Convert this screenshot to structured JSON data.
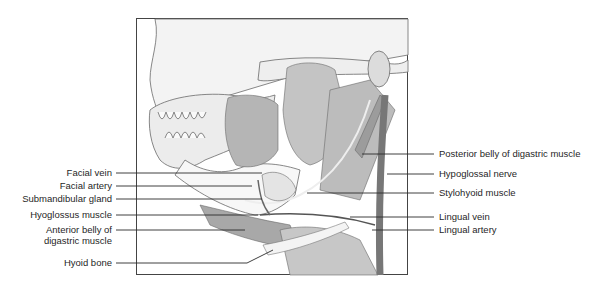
{
  "figure": {
    "frame": {
      "x": 136,
      "y": 18,
      "width": 272,
      "height": 257
    },
    "colors": {
      "line": "#2a2a2a",
      "bone": "#f2f2f2",
      "muscle": "#b9b9b9",
      "muscle_dark": "#8e8e8e",
      "vessel": "#6d6d6d",
      "background": "#ffffff"
    }
  },
  "labels": {
    "left": [
      {
        "id": "facial-vein",
        "text": "Facial vein",
        "y": 173
      },
      {
        "id": "facial-artery",
        "text": "Facial artery",
        "y": 186
      },
      {
        "id": "submandibular-gland",
        "text": "Submandibular gland",
        "y": 199
      },
      {
        "id": "hyoglossus-muscle",
        "text": "Hyoglossus muscle",
        "y": 215
      },
      {
        "id": "anterior-belly-digastric",
        "text": "Anterior belly of\ndigastric muscle",
        "line1": "Anterior belly of",
        "line2": "digastric muscle",
        "y": 230
      },
      {
        "id": "hyoid-bone",
        "text": "Hyoid bone",
        "y": 263
      }
    ],
    "right": [
      {
        "id": "posterior-belly-digastric",
        "text": "Posterior belly of digastric muscle",
        "y": 154
      },
      {
        "id": "hypoglossal-nerve",
        "text": "Hypoglossal nerve",
        "y": 174
      },
      {
        "id": "stylohyoid-muscle",
        "text": "Stylohyoid muscle",
        "y": 193
      },
      {
        "id": "lingual-vein",
        "text": "Lingual vein",
        "y": 217
      },
      {
        "id": "lingual-artery",
        "text": "Lingual artery",
        "y": 230
      }
    ]
  }
}
